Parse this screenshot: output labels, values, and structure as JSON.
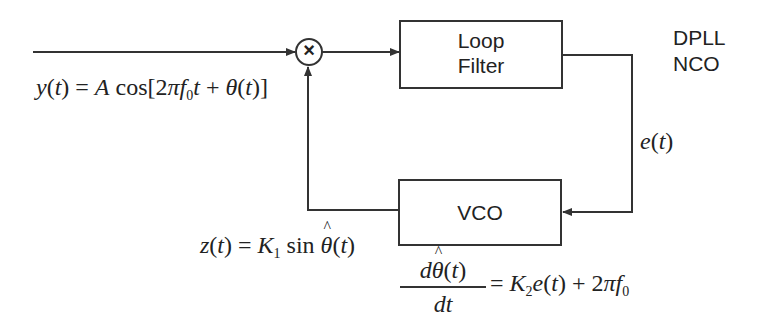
{
  "diagram": {
    "title_lines": [
      "DPLL",
      "NCO"
    ],
    "blocks": {
      "loop_filter": {
        "label_lines": [
          "Loop",
          "Filter"
        ]
      },
      "vco": {
        "label": "VCO"
      },
      "multiplier": {
        "symbol": "×"
      }
    },
    "signals": {
      "input": {
        "lhs": "y(t)",
        "rhs": "A cos[2πf0t + θ(t)]"
      },
      "error": {
        "label": "e(t)"
      },
      "feedback": {
        "lhs": "z(t)",
        "rhs": "K1 sin θ̂(t)"
      },
      "vco_equation": {
        "numerator": "dθ̂(t)",
        "denominator": "dt",
        "rhs": "K2e(t) + 2πf0"
      }
    },
    "colors": {
      "line": "#333333",
      "text": "#222222",
      "background": "#ffffff"
    }
  },
  "text": {
    "title_1": "DPLL",
    "title_2": "NCO",
    "lf_1": "Loop",
    "lf_2": "Filter",
    "vco": "VCO",
    "mult": "×",
    "e": "e",
    "t": "t",
    "y": "y",
    "z": "z",
    "A": "A",
    "cos": "cos",
    "two": "2",
    "pi": "π",
    "f": "f",
    "zero": "0",
    "theta": "θ",
    "K": "K",
    "one": "1",
    "sin": "sin",
    "d": "d",
    "dt": "dt"
  }
}
